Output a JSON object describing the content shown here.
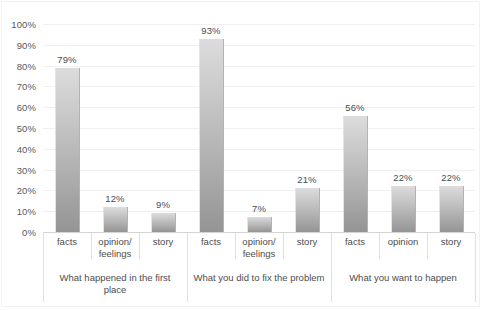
{
  "chart_data": {
    "type": "bar",
    "title": "",
    "subtitle": "",
    "xlabel": "",
    "ylabel": "",
    "ylim": [
      0,
      100
    ],
    "grid": true,
    "legend": "none",
    "y_tick_labels": [
      "100%",
      "90%",
      "80%",
      "70%",
      "60%",
      "50%",
      "40%",
      "30%",
      "20%",
      "10%",
      "0%"
    ],
    "y_tick_values": [
      100,
      90,
      80,
      70,
      60,
      50,
      40,
      30,
      20,
      10,
      0
    ],
    "categories": [
      "facts",
      "opinion/\nfeelings",
      "story",
      "facts",
      "opinion/\nfeelings",
      "story",
      "facts",
      "opinion",
      "story"
    ],
    "values": [
      79,
      12,
      9,
      93,
      7,
      21,
      56,
      22,
      22
    ],
    "data_labels": [
      "79%",
      "12%",
      "9%",
      "93%",
      "7%",
      "21%",
      "56%",
      "22%",
      "22%"
    ],
    "groups": [
      {
        "label": "What happened in the first\nplace",
        "categories": [
          "facts",
          "opinion/\nfeelings",
          "story"
        ],
        "values": [
          79,
          12,
          9
        ],
        "data_labels": [
          "79%",
          "12%",
          "9%"
        ]
      },
      {
        "label": "What you did to fix the problem",
        "categories": [
          "facts",
          "opinion/\nfeelings",
          "story"
        ],
        "values": [
          93,
          7,
          21
        ],
        "data_labels": [
          "93%",
          "7%",
          "21%"
        ]
      },
      {
        "label": "What you want to happen",
        "categories": [
          "facts",
          "opinion",
          "story"
        ],
        "values": [
          56,
          22,
          22
        ],
        "data_labels": [
          "56%",
          "22%",
          "22%"
        ]
      }
    ],
    "colors": {
      "bar_top": "#dcdcdc",
      "bar_bottom": "#949494",
      "gridline": "#f0f0f0",
      "axis_line": "#d4d4d4",
      "text": "#4d4d4d",
      "tick_text": "#595959",
      "background": "#ffffff"
    }
  }
}
